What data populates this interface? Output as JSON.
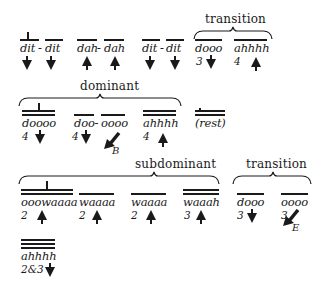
{
  "diagram": {
    "row1": {
      "items": [
        {
          "syllable": "dit",
          "sep": "-",
          "direction": "down",
          "beats": ""
        },
        {
          "syllable": "dit",
          "direction": "down",
          "beats": ""
        },
        {
          "syllable": "dah",
          "sep": "-",
          "direction": "up",
          "beats": ""
        },
        {
          "syllable": "dah",
          "direction": "up",
          "beats": ""
        },
        {
          "syllable": "dit",
          "sep": "-",
          "direction": "down",
          "beats": ""
        },
        {
          "syllable": "dit",
          "direction": "down",
          "beats": ""
        },
        {
          "syllable": "dooo",
          "direction": "down",
          "beats": "3"
        },
        {
          "syllable": "ahhhh",
          "direction": "up",
          "beats": "4"
        }
      ],
      "brace_label": "transition"
    },
    "row2": {
      "brace_label": "dominant",
      "items": [
        {
          "syllable": "doooo",
          "direction": "down",
          "beats": "4"
        },
        {
          "syllable": "doo-",
          "direction": "down",
          "beats": "4"
        },
        {
          "syllable": "oooo",
          "direction": "down-left",
          "beats": "",
          "marker": "B"
        },
        {
          "syllable": "ahhhh",
          "direction": "up",
          "beats": "4"
        },
        {
          "syllable": "(rest)",
          "direction": "",
          "beats": ""
        }
      ]
    },
    "row3": {
      "brace_labels": [
        "subdominant",
        "transition"
      ],
      "items": [
        {
          "syllable": "ooowaaaa",
          "direction": "up",
          "beats": "2"
        },
        {
          "syllable": "waaaa",
          "direction": "up",
          "beats": "2"
        },
        {
          "syllable": "waaaa",
          "direction": "up",
          "beats": "2"
        },
        {
          "syllable": "waaah",
          "direction": "up",
          "beats": "3"
        },
        {
          "syllable": "dooo",
          "direction": "down",
          "beats": "3"
        },
        {
          "syllable": "oooo",
          "direction": "down-left",
          "beats": "3",
          "marker": "E"
        }
      ]
    },
    "row4": {
      "items": [
        {
          "syllable": "ahhhh",
          "direction": "down",
          "beats": "2&3"
        }
      ]
    }
  }
}
